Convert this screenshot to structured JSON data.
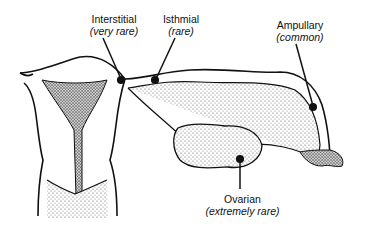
{
  "diagram": {
    "labels": [
      {
        "id": "interstitial",
        "site": "Interstitial",
        "frequency": "(very rare)"
      },
      {
        "id": "isthmial",
        "site": "Isthmial",
        "frequency": "(rare)"
      },
      {
        "id": "ampullary",
        "site": "Ampullary",
        "frequency": "(common)"
      },
      {
        "id": "ovarian",
        "site": "Ovarian",
        "frequency": "(extremely rare)"
      }
    ],
    "colors": {
      "ink": "#111111",
      "background": "#ffffff",
      "stipple": "#555555"
    }
  }
}
